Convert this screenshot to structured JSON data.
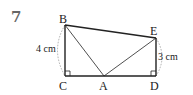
{
  "problem": {
    "number": "7"
  },
  "diagram": {
    "points": {
      "B": {
        "label": "B",
        "x": 65,
        "y": 25
      },
      "C": {
        "label": "C",
        "x": 65,
        "y": 76
      },
      "A": {
        "label": "A",
        "x": 104,
        "y": 76
      },
      "D": {
        "label": "D",
        "x": 156,
        "y": 76
      },
      "E": {
        "label": "E",
        "x": 156,
        "y": 38
      }
    },
    "measurements": {
      "BC": "4 cm",
      "ED": "3 cm"
    },
    "right_angles": [
      "C",
      "D"
    ],
    "segments": [
      "BC",
      "CD",
      "DE",
      "EB",
      "BA",
      "AE"
    ],
    "colors": {
      "line": "#222222",
      "dashed": "#999999",
      "number": "#666666"
    }
  }
}
